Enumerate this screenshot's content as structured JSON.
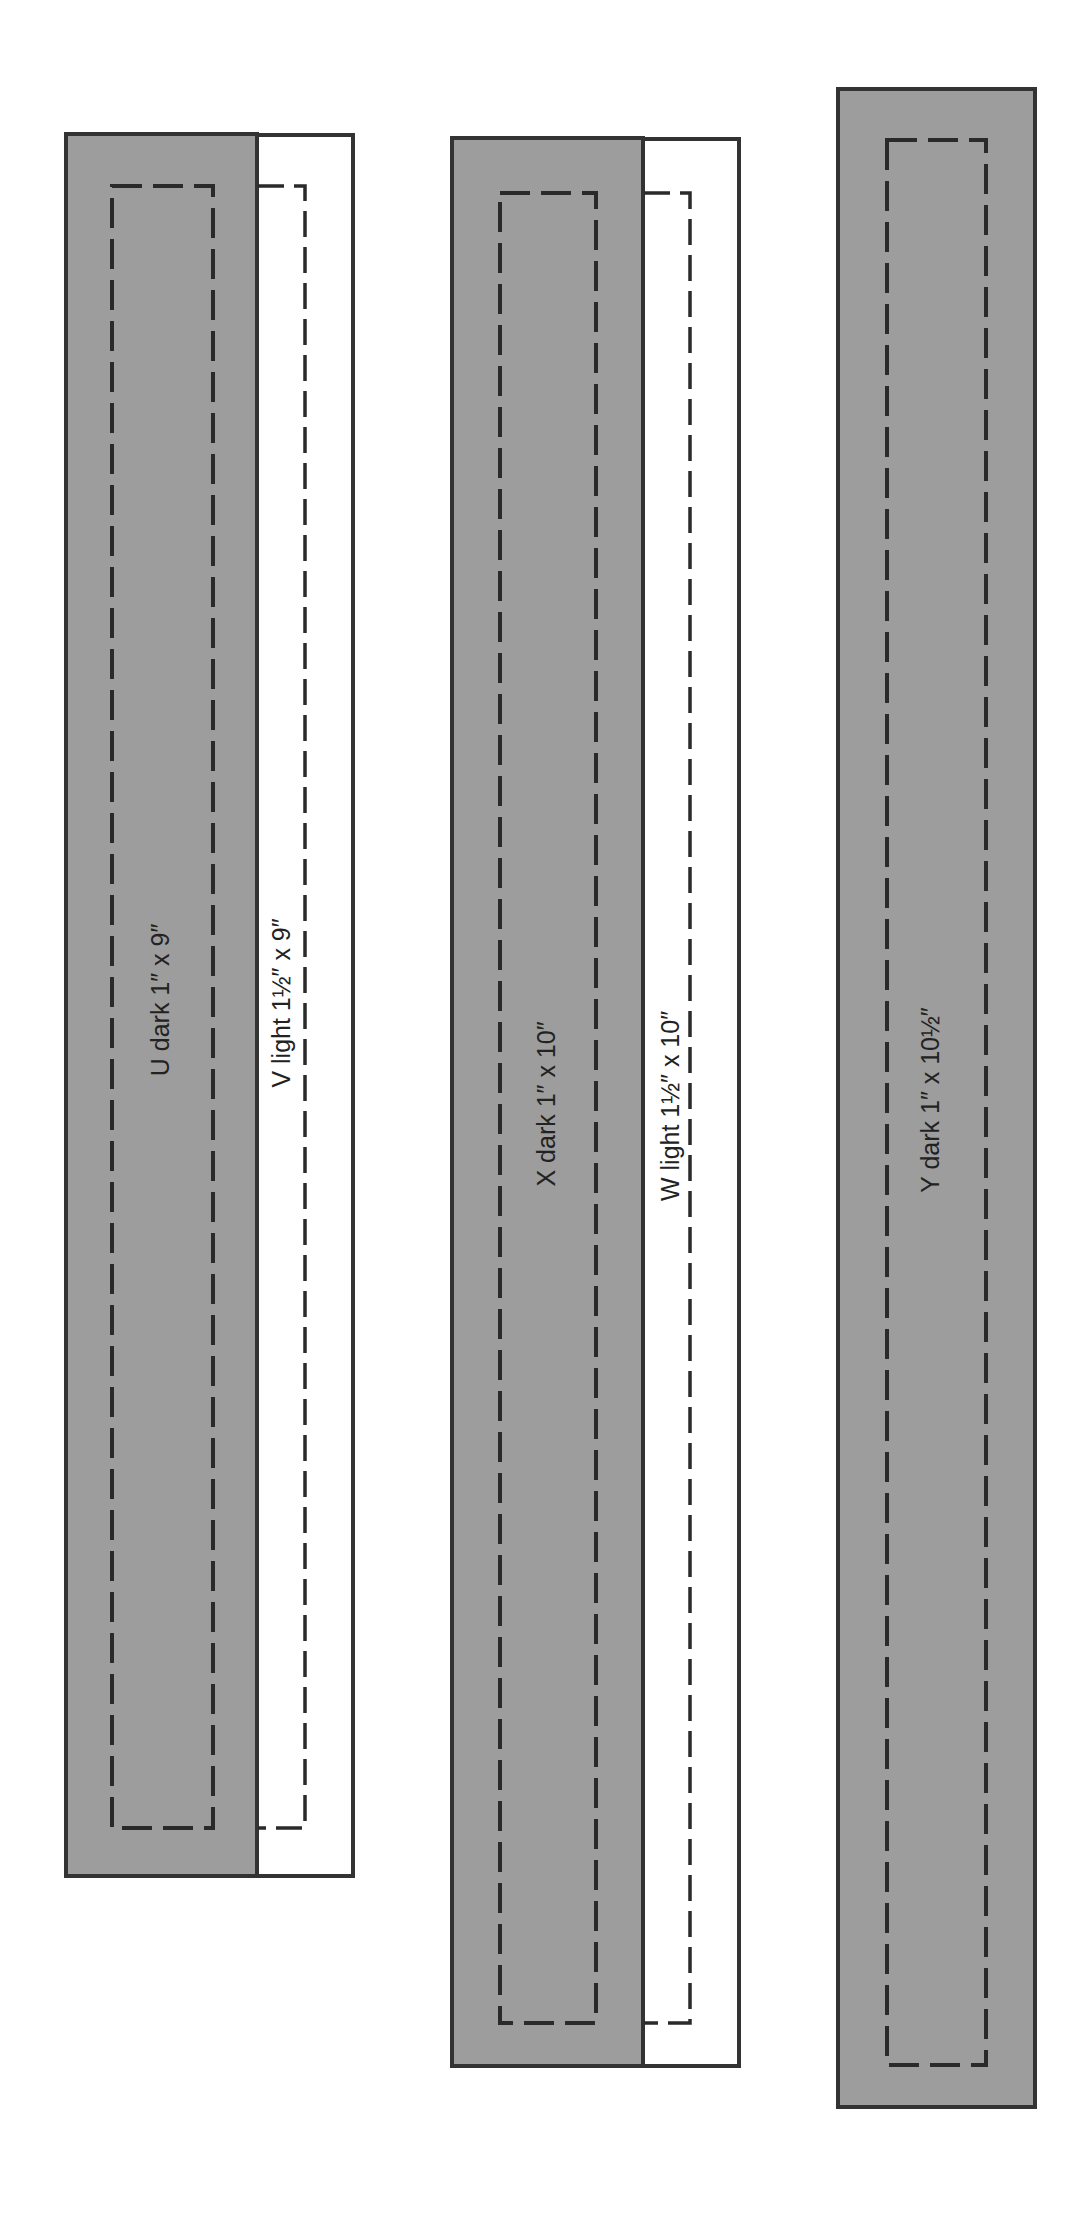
{
  "colors": {
    "dark_fabric": "#9d9d9d",
    "light_fabric": "#ffffff",
    "outline": "#333333",
    "seam": "#2a2a2a",
    "text": "#222222"
  },
  "strips": [
    {
      "id": "U",
      "label": "U dark 1″ x 9″",
      "shade": "dark",
      "width": "1″",
      "length": "9″"
    },
    {
      "id": "V",
      "label": "V light 1½″ x 9″",
      "shade": "light",
      "width": "1½″",
      "length": "9″"
    },
    {
      "id": "X",
      "label": "X dark 1″ x 10″",
      "shade": "dark",
      "width": "1″",
      "length": "10″"
    },
    {
      "id": "W",
      "label": "W light 1½″ x 10″",
      "shade": "light",
      "width": "1½″",
      "length": "10″"
    },
    {
      "id": "Y",
      "label": "Y dark 1″ x 10½″",
      "shade": "dark",
      "width": "1″",
      "length": "10½″"
    }
  ]
}
